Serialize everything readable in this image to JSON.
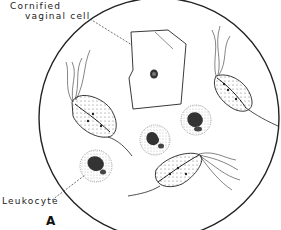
{
  "figure": {
    "panel_letter": "A",
    "labels": {
      "cornified_line1": "Cornified",
      "cornified_line2": "vaginal cell",
      "leukocyte": "Leukocyte"
    },
    "colors": {
      "ink": "#222222",
      "background": "#ffffff"
    },
    "components": [
      "microscope-field",
      "cornified-vaginal-cell",
      "trichomonad-left",
      "trichomonad-right",
      "trichomonad-bottom",
      "leukocyte-center",
      "leukocyte-upper-right",
      "leukocyte-lower-left"
    ]
  }
}
